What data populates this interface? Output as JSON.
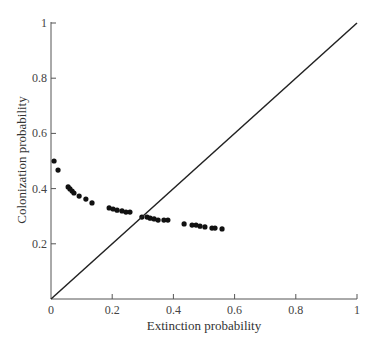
{
  "chart_data": {
    "type": "scatter",
    "title": "",
    "xlabel": "Extinction probability",
    "ylabel": "Colonization probability",
    "xlim": [
      0,
      1
    ],
    "ylim": [
      0,
      1
    ],
    "grid": false,
    "legend": null,
    "x_ticks": [
      "0",
      "0.2",
      "0.4",
      "0.6",
      "0.8",
      "1"
    ],
    "y_ticks": [
      "0.2",
      "0.4",
      "0.6",
      "0.8",
      "1"
    ],
    "series": [
      {
        "name": "observed",
        "marker": "filled-circle",
        "color": "#111111",
        "points": [
          [
            0.01,
            0.5
          ],
          [
            0.023,
            0.467
          ],
          [
            0.056,
            0.406
          ],
          [
            0.062,
            0.399
          ],
          [
            0.069,
            0.391
          ],
          [
            0.075,
            0.384
          ],
          [
            0.092,
            0.373
          ],
          [
            0.114,
            0.362
          ],
          [
            0.134,
            0.348
          ],
          [
            0.19,
            0.33
          ],
          [
            0.203,
            0.326
          ],
          [
            0.216,
            0.322
          ],
          [
            0.232,
            0.319
          ],
          [
            0.245,
            0.315
          ],
          [
            0.258,
            0.315
          ],
          [
            0.297,
            0.297
          ],
          [
            0.314,
            0.297
          ],
          [
            0.324,
            0.293
          ],
          [
            0.337,
            0.29
          ],
          [
            0.35,
            0.286
          ],
          [
            0.369,
            0.286
          ],
          [
            0.382,
            0.286
          ],
          [
            0.435,
            0.272
          ],
          [
            0.461,
            0.268
          ],
          [
            0.474,
            0.268
          ],
          [
            0.487,
            0.264
          ],
          [
            0.503,
            0.261
          ],
          [
            0.526,
            0.257
          ],
          [
            0.536,
            0.257
          ],
          [
            0.559,
            0.254
          ]
        ]
      },
      {
        "name": "equilibrium line (y = x)",
        "type": "line",
        "color": "#222222",
        "points": [
          [
            0,
            0
          ],
          [
            1,
            1
          ]
        ]
      }
    ],
    "annotations": []
  }
}
